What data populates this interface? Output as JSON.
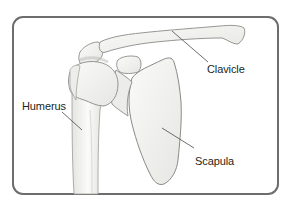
{
  "figure": {
    "type": "anatomical-illustration",
    "frame": {
      "stroke_color": "#6d6d6d",
      "corner_radius": 10
    }
  },
  "labels": [
    {
      "id": "clavicle",
      "text": "Clavicle",
      "x": 207,
      "y": 63
    },
    {
      "id": "humerus",
      "text": "Humerus",
      "x": 22,
      "y": 100
    },
    {
      "id": "scapula",
      "text": "Scapula",
      "x": 195,
      "y": 155
    }
  ],
  "colors": {
    "bone_fill": "#f4f4f2",
    "bone_shade": "#d9d9d6",
    "outline": "#8a8a88",
    "leader_line": "#4a4a4a",
    "text": "#231f20"
  }
}
